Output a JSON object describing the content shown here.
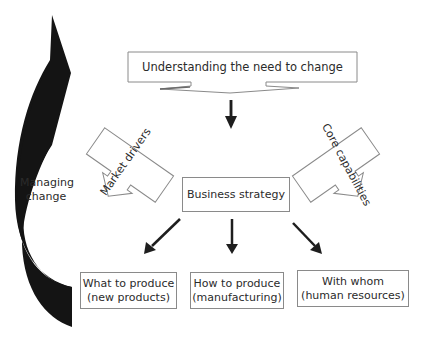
{
  "diagram": {
    "title_banner": "Understanding the need to change",
    "side_label": {
      "line1": "Managing",
      "line2": "change"
    },
    "market_drivers": "Market drivers",
    "core_capabilities": "Core capabilities",
    "center_box": "Business strategy",
    "outputs": [
      {
        "line1": "What to produce",
        "line2": "(new products)"
      },
      {
        "line1": "How to produce",
        "line2": "(manufacturing)"
      },
      {
        "line1": "With whom",
        "line2": "(human resources)"
      }
    ],
    "colors": {
      "stroke": "#8a8a8a",
      "arrow": "#1e1e1e",
      "text": "#2b2b2b",
      "background": "#ffffff"
    }
  }
}
